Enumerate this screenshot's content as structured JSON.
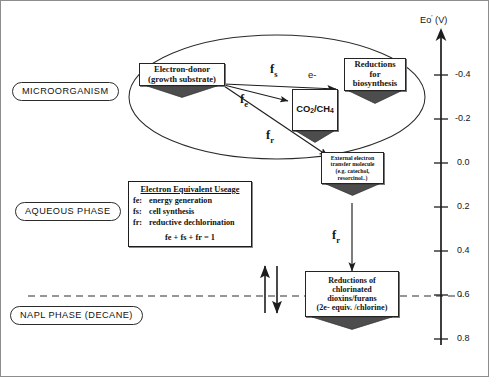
{
  "figure": {
    "phases": [
      {
        "id": "microorganism",
        "label": "MICROORGANISM"
      },
      {
        "id": "aqueous",
        "label": "AQUEOUS PHASE"
      },
      {
        "id": "napl",
        "label": "NAPL PHASE (DECANE)"
      }
    ],
    "nodes": {
      "electron_donor": {
        "lines": [
          "Electron-donor",
          "(growth substrate)"
        ]
      },
      "co2_ch4": {
        "text": "CO2/CH4",
        "formula_parts": [
          "CO",
          "2",
          "/CH",
          "4"
        ]
      },
      "biosynthesis": {
        "lines": [
          "Reductions",
          "for",
          "biosynthesis"
        ]
      },
      "mediator": {
        "lines": [
          "External electron",
          "transfer molecule",
          "(e.g. catechol,",
          "resorcinol..)"
        ]
      },
      "dechlorination": {
        "lines": [
          "Reductions of",
          "chlorinated",
          "dioxins/furans",
          "(2e- equiv. /chlorine)"
        ]
      }
    },
    "flux_labels": {
      "fs": "f",
      "fs_sub": "s",
      "fe": "f",
      "fe_sub": "e",
      "fr": "f",
      "fr_sub": "r",
      "fr2": "f",
      "fr2_sub": "r",
      "electron": "e-"
    },
    "legend": {
      "title": "Electron Equivalent Useage",
      "rows": [
        {
          "key": "fe:",
          "desc": "energy generation"
        },
        {
          "key": "fs:",
          "desc": "cell synthesis"
        },
        {
          "key": "fr:",
          "desc": "reductive dechlorination"
        }
      ],
      "sum": "fe + fs + fr = 1"
    },
    "axis": {
      "title_main": "Eo",
      "title_prime": "'",
      "title_unit": " (V)",
      "ticks": [
        "-0.4",
        "-0.2",
        "0.0",
        "0.2",
        "0.4",
        "0.6",
        "0.8"
      ],
      "tick_y": [
        75,
        119,
        163,
        207,
        251,
        295,
        339
      ]
    },
    "colors": {
      "stroke": "#222222",
      "foot_fill": "#4a4a4a",
      "dashed": "#333333",
      "background": "#ffffff"
    }
  }
}
